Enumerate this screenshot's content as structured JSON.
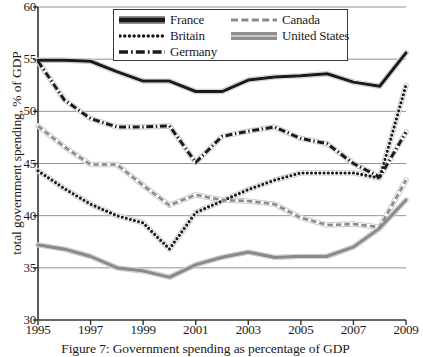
{
  "figure": {
    "caption": "Figure 7: Government spending as percentage of GDP"
  },
  "chart_data": {
    "type": "line",
    "title": "",
    "xlabel": "",
    "ylabel": "total government spending, % of GDP",
    "xlim": [
      1995,
      2009
    ],
    "ylim": [
      30,
      60
    ],
    "ytick_values": [
      30,
      35,
      40,
      45,
      50,
      55,
      60
    ],
    "ytick_labels": [
      "30",
      "35",
      "40",
      "45",
      "50",
      "55",
      "60"
    ],
    "xtick_values": [
      1995,
      1997,
      1999,
      2001,
      2003,
      2005,
      2007,
      2009
    ],
    "xtick_labels": [
      "1995",
      "1997",
      "1999",
      "2001",
      "2003",
      "2005",
      "2007",
      "2009"
    ],
    "grid": "horizontal",
    "legend_position": "top-center",
    "x": [
      1995,
      1996,
      1997,
      1998,
      1999,
      2000,
      2001,
      2002,
      2003,
      2004,
      2005,
      2006,
      2007,
      2008,
      2009
    ],
    "series": [
      {
        "name": "France",
        "style": "solid-thick",
        "color": "#1a1a1a",
        "values": [
          54.9,
          54.9,
          54.8,
          53.8,
          52.9,
          52.9,
          51.9,
          51.9,
          53.0,
          53.3,
          53.4,
          53.6,
          52.8,
          52.4,
          55.6
        ]
      },
      {
        "name": "Britain",
        "style": "dotted",
        "color": "#1a1a1a",
        "values": [
          44.3,
          42.6,
          41.1,
          40.0,
          39.3,
          36.8,
          40.3,
          41.4,
          42.5,
          43.4,
          44.1,
          44.1,
          44.1,
          43.6,
          52.5
        ]
      },
      {
        "name": "Germany",
        "style": "dash-dot",
        "color": "#1a1a1a",
        "values": [
          54.8,
          51.1,
          49.3,
          48.5,
          48.5,
          48.6,
          45.1,
          47.6,
          48.1,
          48.5,
          47.4,
          46.9,
          45.0,
          43.7,
          48.0
        ]
      },
      {
        "name": "Canada",
        "style": "dashed",
        "color": "#8a8a8a",
        "values": [
          48.6,
          46.6,
          44.9,
          44.9,
          42.9,
          41.0,
          42.0,
          41.5,
          41.4,
          41.1,
          39.8,
          39.1,
          39.2,
          38.9,
          43.4
        ]
      },
      {
        "name": "United States",
        "style": "solid-thick-gray",
        "color": "#8a8a8a",
        "values": [
          37.2,
          36.8,
          36.1,
          35.0,
          34.7,
          34.1,
          35.3,
          36.0,
          36.5,
          36.0,
          36.1,
          36.1,
          37.0,
          38.8,
          41.5
        ]
      }
    ]
  },
  "legend": {
    "columns": [
      {
        "entries": [
          {
            "label": "France",
            "swatch": "solid-thick-line-icon"
          },
          {
            "label": "Britain",
            "swatch": "dotted-line-icon"
          },
          {
            "label": "Germany",
            "swatch": "dash-dot-line-icon"
          }
        ]
      },
      {
        "entries": [
          {
            "label": "Canada",
            "swatch": "dashed-line-icon"
          },
          {
            "label": "United States",
            "swatch": "double-gray-line-icon"
          }
        ]
      }
    ]
  }
}
